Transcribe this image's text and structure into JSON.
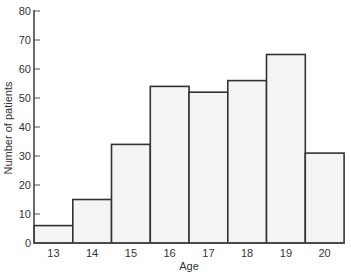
{
  "chart_data": {
    "type": "bar",
    "title": "",
    "xlabel": "Age",
    "ylabel": "Number of patients",
    "categories": [
      "13",
      "14",
      "15",
      "16",
      "17",
      "18",
      "19",
      "20"
    ],
    "values": [
      6,
      15,
      34,
      54,
      52,
      56,
      65,
      31
    ],
    "ylim": [
      0,
      80
    ],
    "yticks": [
      0,
      10,
      20,
      30,
      40,
      50,
      60,
      70,
      80
    ],
    "grid": false,
    "legend": null,
    "bar_fill": "#f4f4f4",
    "bar_stroke": "#333333",
    "histogram_style": true
  }
}
